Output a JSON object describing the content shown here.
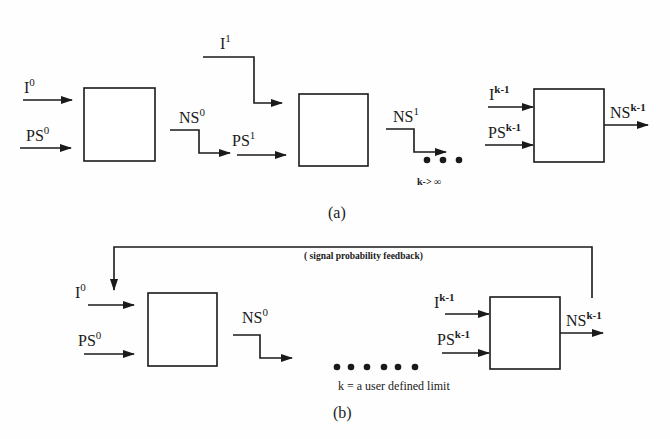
{
  "figure_a": {
    "caption": "(a)",
    "labels": {
      "i0": {
        "base": "I",
        "sup": "0"
      },
      "ps0": {
        "base": "PS",
        "sup": "0"
      },
      "ns0": {
        "base": "NS",
        "sup": "0"
      },
      "i1": {
        "base": "I",
        "sup": "1"
      },
      "ps1": {
        "base": "PS",
        "sup": "1"
      },
      "ns1": {
        "base": "NS",
        "sup": "1"
      },
      "ik1": {
        "base": "I",
        "sup": "k-1"
      },
      "psk1": {
        "base": "PS",
        "sup": "k-1"
      },
      "nsk1": {
        "base": "NS",
        "sup": "k-1"
      }
    },
    "limit_note": "k-> ∞",
    "ellipsis_dots": 3
  },
  "figure_b": {
    "caption": "(b)",
    "feedback_label": "( signal probability feedback)",
    "labels": {
      "i0": {
        "base": "I",
        "sup": "0"
      },
      "ps0": {
        "base": "PS",
        "sup": "0"
      },
      "ns0": {
        "base": "NS",
        "sup": "0"
      },
      "ik1": {
        "base": "I",
        "sup": "k-1"
      },
      "psk1": {
        "base": "PS",
        "sup": "k-1"
      },
      "nsk1": {
        "base": "NS",
        "sup": "k-1"
      }
    },
    "limit_note": "k = a user defined limit",
    "ellipsis_dots": 6
  }
}
